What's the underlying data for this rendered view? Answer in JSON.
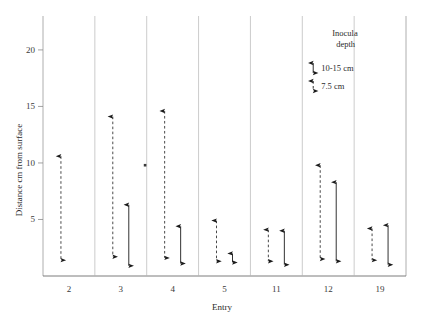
{
  "chart_data": {
    "type": "scatter",
    "title": "",
    "xlabel": "Entry",
    "ylabel": "Distance cm from surface",
    "categories": [
      "2",
      "3",
      "4",
      "5",
      "11",
      "12",
      "19"
    ],
    "ylim": [
      0,
      23
    ],
    "yticks": [
      5,
      10,
      15,
      20
    ],
    "ytick_labels": [
      "5",
      "10",
      "15",
      "20"
    ],
    "grid": false,
    "legend_position": "inside-panel-12-top",
    "legend": {
      "title_line1": "Inocula",
      "title_line2": "depth",
      "entries": [
        {
          "label": "10-15 cm",
          "style": "solid"
        },
        {
          "label": "7.5 cm",
          "style": "dashed"
        }
      ]
    },
    "series": [
      {
        "name": "7.5 cm",
        "style": "dashed",
        "marker": "double-arrow",
        "points": [
          {
            "category": "2",
            "low": 1.4,
            "high": 10.6
          },
          {
            "category": "3",
            "low": 1.7,
            "high": 14.1
          },
          {
            "category": "4",
            "low": 1.6,
            "high": 14.6
          },
          {
            "category": "5",
            "low": 1.3,
            "high": 4.9
          },
          {
            "category": "11",
            "low": 1.3,
            "high": 4.1
          },
          {
            "category": "12",
            "low": 1.5,
            "high": 9.8
          },
          {
            "category": "19",
            "low": 1.4,
            "high": 4.2
          }
        ]
      },
      {
        "name": "10-15 cm",
        "style": "solid",
        "marker": "double-arrow",
        "points": [
          {
            "category": "3",
            "low": 0.9,
            "high": 6.3
          },
          {
            "category": "4",
            "low": 1.1,
            "high": 4.4
          },
          {
            "category": "5",
            "low": 1.2,
            "high": 2.0
          },
          {
            "category": "11",
            "low": 1.0,
            "high": 4.0
          },
          {
            "category": "12",
            "low": 1.3,
            "high": 8.3
          },
          {
            "category": "19",
            "low": 1.0,
            "high": 4.5
          }
        ]
      }
    ],
    "annotations": [
      {
        "category": "3",
        "value": 9.8,
        "type": "outlier-dot"
      }
    ]
  }
}
